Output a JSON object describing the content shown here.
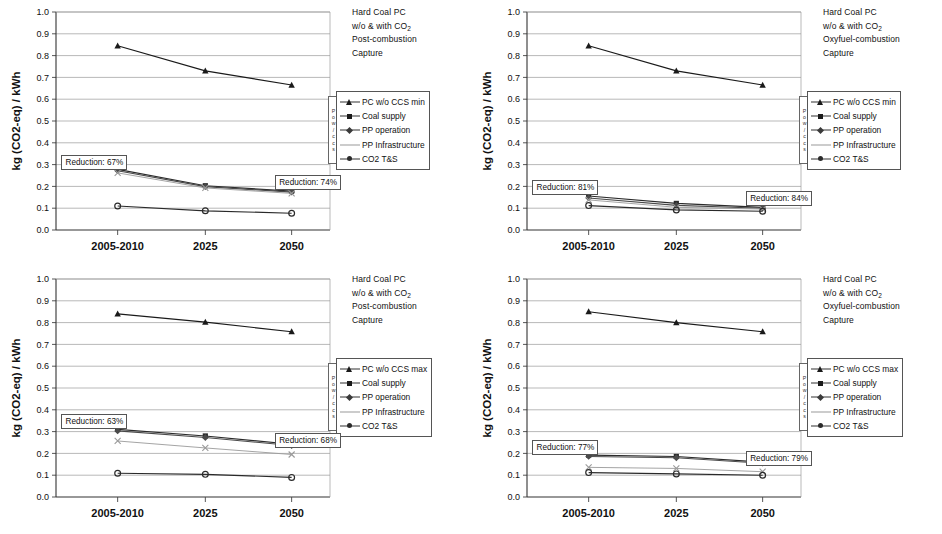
{
  "figure": {
    "width": 942,
    "height": 534,
    "background": "#ffffff",
    "panel_count": 4
  },
  "axis": {
    "y_label": "kg (CO2-eq) / kWh",
    "y_ticks": [
      "1.0",
      "0.9",
      "0.8",
      "0.7",
      "0.6",
      "0.5",
      "0.4",
      "0.3",
      "0.2",
      "0.1",
      "0.0"
    ],
    "y_min": 0.0,
    "y_max": 1.0,
    "y_step": 0.1,
    "categories": [
      "2005-2010",
      "2025",
      "2050"
    ],
    "grid": "horizontal"
  },
  "legend": {
    "side_tab_letters": [
      "P",
      "o",
      "w",
      "/",
      "c",
      "c",
      "s"
    ],
    "entries_min": [
      "PC w/o CCS min",
      "Coal supply",
      "PP operation",
      "PP Infrastructure",
      "CO2 T&S"
    ],
    "entries_max": [
      "PC w/o CCS max",
      "Coal supply",
      "PP operation",
      "PP Infrastructure",
      "CO2 T&S"
    ]
  },
  "colors": {
    "reference_line": "#1a1a1a",
    "coal_supply": "#2b2b2b",
    "pp_operation": "#4a4a4a",
    "pp_infrastructure": "#9a9a9a",
    "co2_ts": "#2a2a2a",
    "grid": "#9b9b9b",
    "frame": "#555555"
  },
  "chart_data": [
    {
      "type": "line",
      "panel": "top-left",
      "title": [
        "Hard Coal PC",
        "w/o & with CO",
        "Post-combustion",
        "Capture"
      ],
      "title_sub": "2",
      "xlabel": "",
      "ylabel": "kg (CO2-eq) / kWh",
      "ylim": [
        0.0,
        1.0
      ],
      "x": [
        "2005-2010",
        "2025",
        "2050"
      ],
      "series": [
        {
          "name": "PC w/o CCS min",
          "values": [
            0.845,
            0.73,
            0.665
          ]
        },
        {
          "name": "Coal supply",
          "values": [
            0.278,
            0.203,
            0.178
          ]
        },
        {
          "name": "PP operation",
          "values": [
            0.272,
            0.199,
            0.174
          ]
        },
        {
          "name": "PP Infrastructure",
          "values": [
            0.262,
            0.193,
            0.168
          ]
        },
        {
          "name": "CO2 T&S",
          "values": [
            0.11,
            0.088,
            0.077
          ]
        }
      ],
      "annotations": [
        {
          "text": "Reduction: 67%",
          "x_frac": 0.02,
          "y_value": 0.315
        },
        {
          "text": "Reduction: 74%",
          "x_frac": 0.8,
          "y_value": 0.225
        }
      ]
    },
    {
      "type": "line",
      "panel": "top-right",
      "title": [
        "Hard Coal PC",
        "w/o & with CO",
        "Oxyfuel-combustion",
        "Capture"
      ],
      "title_sub": "2",
      "xlabel": "",
      "ylabel": "kg (CO2-eq) / kWh",
      "ylim": [
        0.0,
        1.0
      ],
      "x": [
        "2005-2010",
        "2025",
        "2050"
      ],
      "series": [
        {
          "name": "PC w/o CCS min",
          "values": [
            0.845,
            0.73,
            0.665
          ]
        },
        {
          "name": "Coal supply",
          "values": [
            0.156,
            0.122,
            0.104
          ]
        },
        {
          "name": "PP operation",
          "values": [
            0.147,
            0.113,
            0.1
          ]
        },
        {
          "name": "PP Infrastructure",
          "values": [
            0.138,
            0.104,
            0.096
          ]
        },
        {
          "name": "CO2 T&S",
          "values": [
            0.112,
            0.092,
            0.086
          ]
        }
      ],
      "annotations": [
        {
          "text": "Reduction: 81%",
          "x_frac": 0.02,
          "y_value": 0.2
        },
        {
          "text": "Reduction: 84%",
          "x_frac": 0.8,
          "y_value": 0.15
        }
      ]
    },
    {
      "type": "line",
      "panel": "bottom-left",
      "title": [
        "Hard Coal PC",
        "w/o & with CO",
        "Post-combustion",
        "Capture"
      ],
      "title_sub": "2",
      "xlabel": "",
      "ylabel": "kg (CO2-eq) / kWh",
      "ylim": [
        0.0,
        1.0
      ],
      "x": [
        "2005-2010",
        "2025",
        "2050"
      ],
      "series": [
        {
          "name": "PC w/o CCS max",
          "values": [
            0.84,
            0.802,
            0.758
          ]
        },
        {
          "name": "Coal supply",
          "values": [
            0.31,
            0.28,
            0.242
          ]
        },
        {
          "name": "PP operation",
          "values": [
            0.303,
            0.273,
            0.236
          ]
        },
        {
          "name": "PP Infrastructure",
          "values": [
            0.257,
            0.225,
            0.195
          ]
        },
        {
          "name": "CO2 T&S",
          "values": [
            0.109,
            0.104,
            0.09
          ]
        }
      ],
      "annotations": [
        {
          "text": "Reduction: 63%",
          "x_frac": 0.02,
          "y_value": 0.352
        },
        {
          "text": "Reduction: 68%",
          "x_frac": 0.8,
          "y_value": 0.268
        }
      ]
    },
    {
      "type": "line",
      "panel": "bottom-right",
      "title": [
        "Hard Coal PC",
        "w/o & with CO",
        "Oxyfuel-combustion",
        "Capture"
      ],
      "title_sub": "2",
      "xlabel": "",
      "ylabel": "kg (CO2-eq) / kWh",
      "ylim": [
        0.0,
        1.0
      ],
      "x": [
        "2005-2010",
        "2025",
        "2050"
      ],
      "series": [
        {
          "name": "PC w/o CCS max",
          "values": [
            0.85,
            0.8,
            0.758
          ]
        },
        {
          "name": "Coal supply",
          "values": [
            0.192,
            0.186,
            0.16
          ]
        },
        {
          "name": "PP operation",
          "values": [
            0.186,
            0.18,
            0.155
          ]
        },
        {
          "name": "PP Infrastructure",
          "values": [
            0.136,
            0.131,
            0.116
          ]
        },
        {
          "name": "CO2 T&S",
          "values": [
            0.112,
            0.106,
            0.1
          ]
        }
      ],
      "annotations": [
        {
          "text": "Reduction: 77%",
          "x_frac": 0.02,
          "y_value": 0.232
        },
        {
          "text": "Reduction: 79%",
          "x_frac": 0.8,
          "y_value": 0.182
        }
      ]
    }
  ]
}
